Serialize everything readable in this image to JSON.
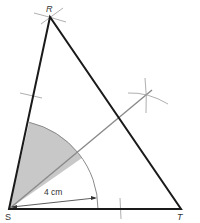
{
  "diagram": {
    "type": "geometric-construction",
    "vertices": {
      "R": {
        "label": "R",
        "x": 50,
        "y": 17
      },
      "S": {
        "label": "S",
        "x": 9,
        "y": 209
      },
      "T": {
        "label": "T",
        "x": 181,
        "y": 209
      }
    },
    "measurement": {
      "label": "4 cm",
      "radius_px": 89
    },
    "colors": {
      "triangle": "#1a1a1a",
      "construction": "#8a8a8a",
      "shading": "#c8c8c8",
      "bisector": "#7a7a7a"
    }
  }
}
